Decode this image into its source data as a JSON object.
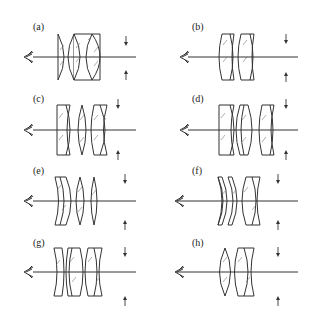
{
  "figure": {
    "panels": [
      {
        "label": "(a)",
        "elements": 3,
        "note": "plano-convex + cemented doublet"
      },
      {
        "label": "(b)",
        "elements": 2,
        "note": "two cemented doublets"
      },
      {
        "label": "(c)",
        "elements": 3,
        "note": "doublet, singlet, doublet"
      },
      {
        "label": "(d)",
        "elements": 3,
        "note": "doublet, singlet, meniscus doublet"
      },
      {
        "label": "(e)",
        "elements": 3,
        "note": "meniscus doublet, two singlets"
      },
      {
        "label": "(f)",
        "elements": 3,
        "note": "two meniscus, cemented doublet"
      },
      {
        "label": "(g)",
        "elements": 3,
        "note": "meniscus, doublet, doublet"
      },
      {
        "label": "(h)",
        "elements": 2,
        "note": "biconvex singlet + cemented doublet"
      }
    ]
  },
  "colors": {
    "line": "#333333",
    "hatch": "#777777",
    "background": "#ffffff"
  }
}
